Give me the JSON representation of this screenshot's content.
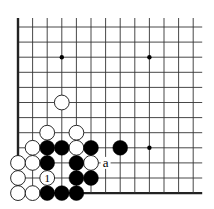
{
  "diagram": {
    "type": "go-board-fragment",
    "grid": {
      "columns": 13,
      "rows": 12,
      "origin_x": 18,
      "origin_y": 27,
      "col_spacing": 14.6,
      "row_spacing": 15.1,
      "edges": {
        "left": true,
        "bottom": true,
        "top": false,
        "right": false
      },
      "line_color": "#333333",
      "edge_color": "#222222"
    },
    "star_points": [
      {
        "col": 3,
        "row": 2
      },
      {
        "col": 9,
        "row": 2
      },
      {
        "col": 9,
        "row": 8
      }
    ],
    "stones": {
      "white": [
        {
          "col": 3,
          "row": 5
        },
        {
          "col": 2,
          "row": 7
        },
        {
          "col": 4,
          "row": 7
        },
        {
          "col": 1,
          "row": 8
        },
        {
          "col": 4,
          "row": 8
        },
        {
          "col": 0,
          "row": 9
        },
        {
          "col": 1,
          "row": 9
        },
        {
          "col": 5,
          "row": 9
        },
        {
          "col": 0,
          "row": 10
        },
        {
          "col": 2,
          "row": 10,
          "label": "1"
        },
        {
          "col": 0,
          "row": 11
        },
        {
          "col": 1,
          "row": 11
        }
      ],
      "black": [
        {
          "col": 2,
          "row": 8
        },
        {
          "col": 3,
          "row": 8
        },
        {
          "col": 5,
          "row": 8
        },
        {
          "col": 7,
          "row": 8
        },
        {
          "col": 2,
          "row": 9
        },
        {
          "col": 4,
          "row": 9
        },
        {
          "col": 4,
          "row": 10
        },
        {
          "col": 5,
          "row": 10
        },
        {
          "col": 2,
          "row": 11
        },
        {
          "col": 3,
          "row": 11
        },
        {
          "col": 4,
          "row": 11
        }
      ]
    },
    "labels": [
      {
        "col": 6,
        "row": 9,
        "text": "a"
      }
    ],
    "colors": {
      "black_stone": "#000000",
      "white_stone": "#ffffff",
      "stone_outline": "#111111",
      "background": "#ffffff"
    }
  }
}
